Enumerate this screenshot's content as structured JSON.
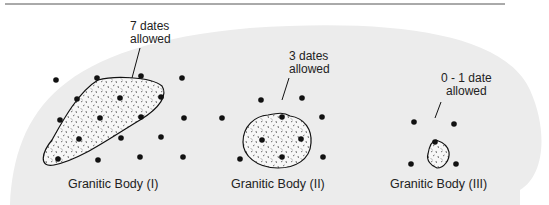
{
  "figure": {
    "bodies": [
      {
        "id": "I",
        "caption": "Granitic Body (I)",
        "annotation_line1": "7 dates",
        "annotation_line2": "allowed"
      },
      {
        "id": "II",
        "caption": "Granitic Body (II)",
        "annotation_line1": "3 dates",
        "annotation_line2": "allowed"
      },
      {
        "id": "III",
        "caption": "Granitic Body (III)",
        "annotation_line1": "0 - 1 date",
        "annotation_line2": "allowed"
      }
    ],
    "colors": {
      "background_blob": "#ececec",
      "dot": "#111111",
      "outline": "#111111"
    }
  }
}
